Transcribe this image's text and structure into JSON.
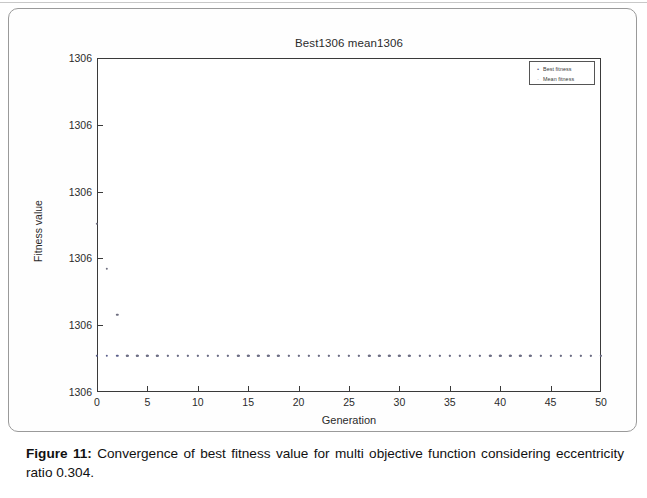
{
  "figure": {
    "caption_label": "Figure 11:",
    "caption_text": " Convergence of best fitness value for multi objective function considering eccentricity ratio 0.304."
  },
  "chart_data": {
    "type": "scatter",
    "title": "Best1306 mean1306",
    "xlabel": "Generation",
    "ylabel": "Fitness value",
    "xlim": [
      0,
      50
    ],
    "ylim": [
      0,
      1
    ],
    "grid": false,
    "legend_position": "top-right",
    "xticks": [
      "0",
      "5",
      "10",
      "15",
      "20",
      "25",
      "30",
      "35",
      "40",
      "45",
      "50"
    ],
    "xtick_values": [
      0,
      5,
      10,
      15,
      20,
      25,
      30,
      35,
      40,
      45,
      50
    ],
    "yticks": [
      "1306",
      "1306",
      "1306",
      "1306",
      "1306",
      "1306"
    ],
    "ytick_values": [
      1.0,
      0.8,
      0.6,
      0.4,
      0.2,
      0.0
    ],
    "legend": [
      {
        "label": "Best fitness",
        "marker": "•",
        "color": "#5b5f8a"
      },
      {
        "label": "Mean fitness",
        "marker": "·",
        "color": "#6f6f80"
      }
    ],
    "series": [
      {
        "name": "Best fitness",
        "marker": "dot",
        "color": "#5b5f8a",
        "x": [
          0,
          1,
          2,
          3,
          4,
          5,
          6,
          7,
          8,
          9,
          10,
          11,
          12,
          13,
          14,
          15,
          16,
          17,
          18,
          19,
          20,
          21,
          22,
          23,
          24,
          25,
          26,
          27,
          28,
          29,
          30,
          31,
          32,
          33,
          34,
          35,
          36,
          37,
          38,
          39,
          40,
          41,
          42,
          43,
          44,
          45,
          46,
          47,
          48,
          49,
          50
        ],
        "values": [
          0.108,
          0.108,
          0.108,
          0.108,
          0.108,
          0.108,
          0.108,
          0.108,
          0.108,
          0.108,
          0.108,
          0.108,
          0.108,
          0.108,
          0.108,
          0.108,
          0.108,
          0.108,
          0.108,
          0.108,
          0.108,
          0.108,
          0.108,
          0.108,
          0.108,
          0.108,
          0.108,
          0.108,
          0.108,
          0.108,
          0.108,
          0.108,
          0.108,
          0.108,
          0.108,
          0.108,
          0.108,
          0.108,
          0.108,
          0.108,
          0.108,
          0.108,
          0.108,
          0.108,
          0.108,
          0.108,
          0.108,
          0.108,
          0.108,
          0.108,
          0.108
        ]
      },
      {
        "name": "Mean fitness",
        "marker": "dot",
        "color": "#6f6f80",
        "x": [
          0,
          1,
          2,
          3,
          4,
          5,
          6,
          7,
          8,
          9,
          10,
          11,
          12,
          13,
          14,
          15,
          16,
          17,
          18,
          19,
          20,
          21,
          22,
          23,
          24,
          25,
          26,
          27,
          28,
          29,
          30,
          31,
          32,
          33,
          34,
          35,
          36,
          37,
          38,
          39,
          40,
          41,
          42,
          43,
          44,
          45,
          46,
          47,
          48,
          49,
          50
        ],
        "values": [
          0.503,
          0.368,
          0.231,
          0.108,
          0.108,
          0.108,
          0.108,
          0.108,
          0.108,
          0.108,
          0.108,
          0.108,
          0.108,
          0.108,
          0.108,
          0.108,
          0.108,
          0.108,
          0.108,
          0.108,
          0.108,
          0.108,
          0.108,
          0.108,
          0.108,
          0.108,
          0.108,
          0.108,
          0.108,
          0.108,
          0.108,
          0.108,
          0.108,
          0.108,
          0.108,
          0.108,
          0.108,
          0.108,
          0.108,
          0.108,
          0.108,
          0.108,
          0.108,
          0.108,
          0.108,
          0.108,
          0.108,
          0.108,
          0.108,
          0.108,
          0.108
        ]
      }
    ]
  }
}
